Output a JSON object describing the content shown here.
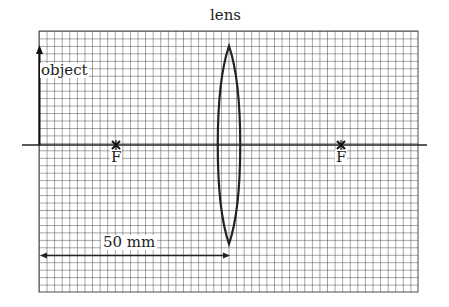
{
  "diagram": {
    "title_label": "lens",
    "object_label": "object",
    "focal_point_left_label": "F",
    "focal_point_right_label": "F",
    "dimension_label": "50 mm",
    "grid": {
      "columns": 50,
      "rows": 35,
      "cell_px": 7.58,
      "line_color": "#3a3a3a"
    },
    "colors": {
      "ink": "#222222",
      "grid": "#3a3a3a",
      "background": "#ffffff"
    }
  }
}
